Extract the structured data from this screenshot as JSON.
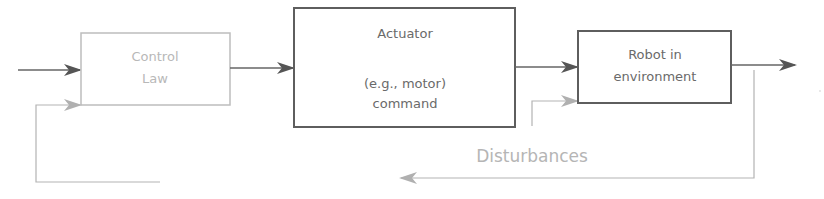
{
  "diagram": {
    "blocks": {
      "control_law": {
        "line1": "Control",
        "line2": "Law"
      },
      "actuator": {
        "line1": "Actuator",
        "line2": "(e.g., motor)",
        "line3": "command"
      },
      "robot": {
        "line1": "Robot in",
        "line2": "environment"
      }
    },
    "disturbances_label": "Disturbances",
    "colors": {
      "dark_line": "#5e5e5e",
      "light_line": "#b3b3b3",
      "control_law_border": "#b8b8b8",
      "text_dark": "#6a6a6a",
      "text_light": "#b8b8b8"
    }
  }
}
